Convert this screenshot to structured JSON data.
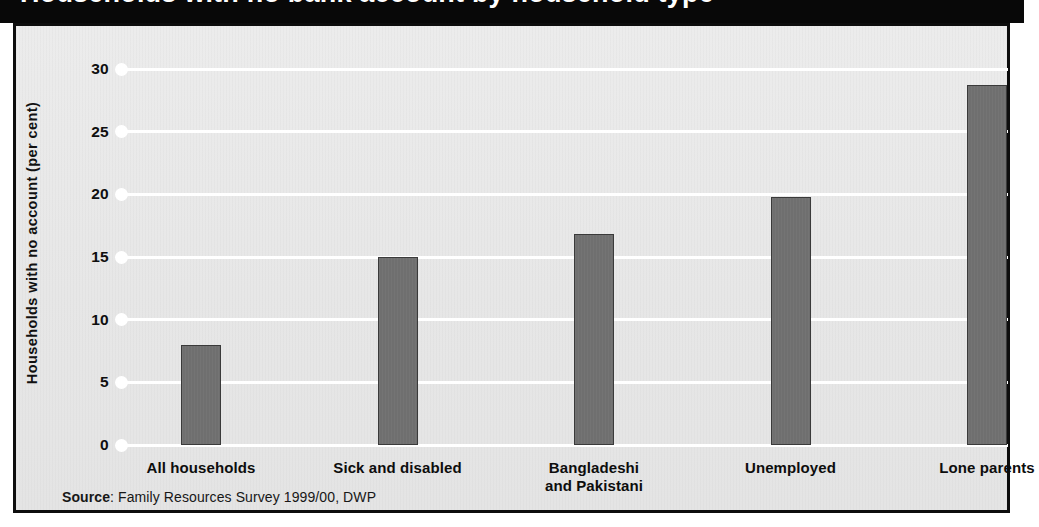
{
  "title": {
    "text": "Households with no bank account by household type"
  },
  "axes": {
    "ylabel": "Households with no account (per cent)",
    "yticks": [
      "0",
      "5",
      "10",
      "15",
      "20",
      "25",
      "30"
    ]
  },
  "source": {
    "key": "Source",
    "separator": ": ",
    "text": "Family Resources Survey 1999/00, DWP"
  },
  "colors": {
    "bar_fill": "#6f6f6f",
    "bar_edge": "#3a3a3a",
    "panel_background": "#e8e8e8",
    "gridline": "#ffffff",
    "frame": "#0d0d0d",
    "title_band": "#080808"
  },
  "chart_data": {
    "type": "bar",
    "title": "Households with no bank account by household type",
    "xlabel": "",
    "ylabel": "Households with no account (per cent)",
    "ylim": [
      0,
      31
    ],
    "yticks": [
      0,
      5,
      10,
      15,
      20,
      25,
      30
    ],
    "grid": true,
    "legend": false,
    "categories": [
      "All households",
      "Sick and disabled",
      "Bangladeshi and Pakistani",
      "Unemployed",
      "Lone parents"
    ],
    "category_lines": [
      [
        "All households"
      ],
      [
        "Sick and disabled"
      ],
      [
        "Bangladeshi",
        "and Pakistani"
      ],
      [
        "Unemployed"
      ],
      [
        "Lone parents"
      ]
    ],
    "values": [
      8.0,
      15.0,
      16.8,
      19.8,
      28.7
    ],
    "source": "Family Resources Survey 1999/00, DWP"
  }
}
